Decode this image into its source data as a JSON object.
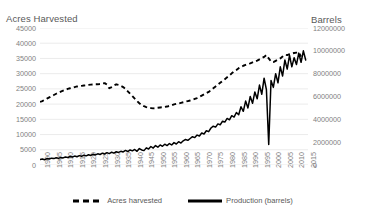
{
  "chart_data": {
    "type": "line",
    "title": "",
    "xlabel": "",
    "left_axis": {
      "title": "Acres Harvested",
      "ticks": [
        "0",
        "5000",
        "10000",
        "15000",
        "20000",
        "25000",
        "30000",
        "35000",
        "40000",
        "45000"
      ],
      "min": 0,
      "max": 45000,
      "step": 5000
    },
    "right_axis": {
      "title": "Barrels",
      "ticks": [
        "0",
        "2000000",
        "4000000",
        "6000000",
        "8000000",
        "10000000",
        "12000000"
      ],
      "min": 0,
      "max": 12000000,
      "step": 2000000
    },
    "xticks": [
      "1900",
      "1905",
      "1910",
      "1915",
      "1920",
      "1925",
      "1930",
      "1935",
      "1940",
      "1945",
      "1950",
      "1955",
      "1960",
      "1965",
      "1970",
      "1975",
      "1980",
      "1985",
      "1990",
      "1995",
      "2000",
      "2005",
      "2010",
      "2015"
    ],
    "xlim": [
      1900,
      2016
    ],
    "grid": true,
    "legend_position": "bottom",
    "series": [
      {
        "name": "Acres harvested",
        "axis": "left",
        "style": "dashed",
        "color": "#000000",
        "x": [
          1900,
          1901,
          1902,
          1903,
          1904,
          1905,
          1906,
          1907,
          1908,
          1909,
          1910,
          1911,
          1912,
          1913,
          1914,
          1915,
          1916,
          1917,
          1918,
          1919,
          1920,
          1921,
          1922,
          1923,
          1924,
          1925,
          1926,
          1927,
          1928,
          1929,
          1930,
          1931,
          1932,
          1933,
          1934,
          1935,
          1936,
          1937,
          1938,
          1939,
          1940,
          1941,
          1942,
          1943,
          1944,
          1945,
          1946,
          1947,
          1948,
          1949,
          1950,
          1951,
          1952,
          1953,
          1954,
          1955,
          1956,
          1957,
          1958,
          1959,
          1960,
          1961,
          1962,
          1963,
          1964,
          1965,
          1966,
          1967,
          1968,
          1969,
          1970,
          1971,
          1972,
          1973,
          1974,
          1975,
          1976,
          1977,
          1978,
          1979,
          1980,
          1981,
          1982,
          1983,
          1984,
          1985,
          1986,
          1987,
          1988,
          1989,
          1990,
          1991,
          1992,
          1993,
          1994,
          1995,
          1996,
          1997,
          1998,
          1999,
          2000,
          2001,
          2002,
          2003,
          2004,
          2005,
          2006,
          2007,
          2008,
          2009,
          2010,
          2011,
          2012,
          2013
        ],
        "values": [
          20700,
          21000,
          21400,
          21800,
          22200,
          22600,
          23000,
          23400,
          23800,
          24100,
          24400,
          24700,
          25000,
          25200,
          25400,
          25600,
          25800,
          25900,
          26000,
          26100,
          26200,
          26300,
          26400,
          26450,
          26500,
          26500,
          26600,
          26800,
          26900,
          26400,
          25200,
          25600,
          26100,
          26500,
          26300,
          26000,
          25600,
          25000,
          24200,
          23400,
          22600,
          21800,
          21000,
          20300,
          19700,
          19300,
          19000,
          18800,
          18700,
          18600,
          18700,
          18800,
          18900,
          19000,
          19100,
          19200,
          19400,
          19600,
          19900,
          20100,
          20200,
          20400,
          20600,
          20800,
          21000,
          21200,
          21400,
          21700,
          22000,
          22400,
          22800,
          23200,
          23600,
          24000,
          24600,
          25200,
          25800,
          26400,
          27000,
          27600,
          28200,
          28800,
          29400,
          30100,
          30700,
          31200,
          31800,
          32200,
          32600,
          32900,
          33200,
          33400,
          33700,
          34000,
          34300,
          34700,
          35100,
          35500,
          36100,
          35000,
          34000,
          33800,
          34200,
          34600,
          35000,
          35600,
          36200,
          36100,
          36400,
          36600,
          36800,
          36900,
          37000,
          35600
        ]
      },
      {
        "name": "Production (barrels)",
        "axis": "right",
        "style": "solid",
        "color": "#000000",
        "x": [
          1900,
          1901,
          1902,
          1903,
          1904,
          1905,
          1906,
          1907,
          1908,
          1909,
          1910,
          1911,
          1912,
          1913,
          1914,
          1915,
          1916,
          1917,
          1918,
          1919,
          1920,
          1921,
          1922,
          1923,
          1924,
          1925,
          1926,
          1927,
          1928,
          1929,
          1930,
          1931,
          1932,
          1933,
          1934,
          1935,
          1936,
          1937,
          1938,
          1939,
          1940,
          1941,
          1942,
          1943,
          1944,
          1945,
          1946,
          1947,
          1948,
          1949,
          1950,
          1951,
          1952,
          1953,
          1954,
          1955,
          1956,
          1957,
          1958,
          1959,
          1960,
          1961,
          1962,
          1963,
          1964,
          1965,
          1966,
          1967,
          1968,
          1969,
          1970,
          1971,
          1972,
          1973,
          1974,
          1975,
          1976,
          1977,
          1978,
          1979,
          1980,
          1981,
          1982,
          1983,
          1984,
          1985,
          1986,
          1987,
          1988,
          1989,
          1990,
          1991,
          1992,
          1993,
          1994,
          1995,
          1996,
          1997,
          1998,
          1999,
          2000,
          2001,
          2002,
          2003,
          2004,
          2005,
          2006,
          2007,
          2008,
          2009,
          2010,
          2011,
          2012,
          2013,
          2014,
          2015
        ],
        "values": [
          480000,
          520000,
          460000,
          560000,
          520000,
          600000,
          560000,
          640000,
          580000,
          660000,
          620000,
          700000,
          660000,
          740000,
          700000,
          780000,
          720000,
          820000,
          760000,
          860000,
          800000,
          900000,
          840000,
          940000,
          880000,
          980000,
          920000,
          1040000,
          960000,
          1080000,
          1000000,
          1120000,
          1040000,
          1160000,
          1100000,
          1200000,
          1140000,
          1280000,
          1180000,
          1320000,
          1240000,
          1360000,
          1200000,
          1440000,
          1320000,
          1260000,
          1500000,
          1400000,
          1620000,
          1480000,
          1700000,
          1560000,
          1760000,
          1640000,
          1820000,
          1700000,
          1880000,
          1760000,
          1960000,
          1840000,
          2040000,
          1920000,
          2120000,
          2240000,
          2160000,
          2320000,
          2480000,
          2400000,
          2620000,
          2540000,
          2800000,
          2720000,
          3000000,
          2920000,
          3240000,
          3400000,
          3320000,
          3600000,
          3520000,
          3840000,
          3760000,
          4080000,
          3960000,
          4320000,
          4200000,
          4600000,
          4400000,
          5100000,
          4700000,
          5600000,
          5000000,
          6000000,
          5400000,
          6400000,
          5800000,
          7000000,
          6200000,
          7600000,
          6600000,
          1800000,
          7400000,
          6800000,
          8000000,
          7200000,
          8600000,
          7800000,
          9200000,
          8400000,
          9600000,
          8600000,
          9400000,
          8800000,
          9800000,
          9000000,
          10000000,
          9200000
        ]
      }
    ]
  },
  "legend": {
    "items": [
      {
        "label": "Acres harvested",
        "style": "dashed"
      },
      {
        "label": "Production (barrels)",
        "style": "solid"
      }
    ]
  }
}
